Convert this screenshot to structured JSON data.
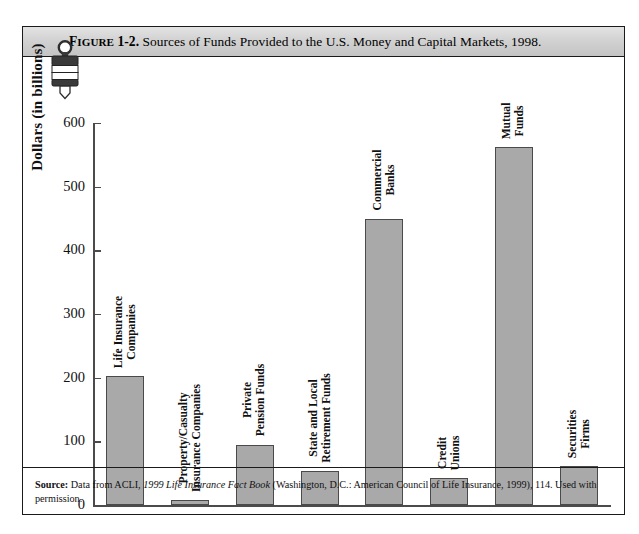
{
  "figure": {
    "icon_name": "bookmark-stamp-icon",
    "caption_prefix": "FIGURE",
    "caption_number": "1-2.",
    "caption_title": "Sources of Funds Provided to the U.S. Money and Capital Markets, 1998.",
    "source_label": "Source:",
    "source_text_1": "Data from ACLI,",
    "source_text_italic": "1999 Life Insurance Fact Book",
    "source_text_2": "(Washington, D.C.: American Council of Life Insurance, 1999), 114. Used with permission.",
    "frame_color": "#1a1a1a",
    "caption_bar_color": "#d2d2d2"
  },
  "chart_data": {
    "type": "bar",
    "title": "Sources of Funds Provided to the U.S. Money and Capital Markets, 1998.",
    "xlabel": "",
    "ylabel": "Dollars (in billions)",
    "ylim": [
      0,
      600
    ],
    "yticks": [
      0,
      100,
      200,
      300,
      400,
      500,
      600
    ],
    "ytick_labels": [
      "0",
      "100",
      "200",
      "300",
      "400",
      "500",
      "600"
    ],
    "grid": false,
    "legend": false,
    "bar_color": "#a9a9a9",
    "bar_border_color": "#4a4a4a",
    "categories": [
      "Life Insurance Companies",
      "Property/Casualty Insurance Companies",
      "Private Pension Funds",
      "State and Local Retirement Funds",
      "Commercial Banks",
      "Credit Unions",
      "Mutual Funds",
      "Securities Firms"
    ],
    "category_lines": [
      [
        "Life Insurance",
        "Companies"
      ],
      [
        "Property/Casualty",
        "Insurance Companies"
      ],
      [
        "Private",
        "Pension Funds"
      ],
      [
        "State and Local",
        "Retirement Funds"
      ],
      [
        "Commercial",
        "Banks"
      ],
      [
        "Credit",
        "Unions"
      ],
      [
        "Mutual",
        "Funds"
      ],
      [
        "Securities",
        "Firms"
      ]
    ],
    "values": [
      202,
      8,
      95,
      53,
      450,
      42,
      562,
      62
    ]
  }
}
